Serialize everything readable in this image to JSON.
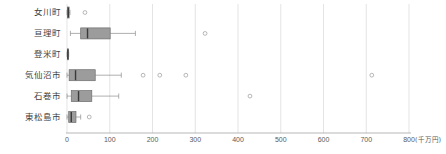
{
  "chart_data": {
    "type": "box",
    "title": "",
    "xlabel": "(千万円)",
    "ylabel": "",
    "xlim": [
      0,
      800
    ],
    "xticks": [
      0,
      100,
      200,
      300,
      400,
      500,
      600,
      700,
      800
    ],
    "xtick_labels": [
      "0",
      "100",
      "200",
      "300",
      "400",
      "500",
      "600",
      "700",
      "800"
    ],
    "unit_note": "(千万円)",
    "grid": true,
    "orientation": "horizontal",
    "legend": "none",
    "categories": [
      "女川町",
      "亘理町",
      "登米町",
      "気仙沼市",
      "石巻市",
      "東松島市"
    ],
    "boxes": [
      {
        "category": "女川町",
        "whisker_low": 0,
        "q1": 1,
        "median": 3,
        "q3": 5,
        "whisker_high": 7,
        "outliers": [
          42
        ]
      },
      {
        "category": "亘理町",
        "whisker_low": 8,
        "q1": 32,
        "median": 48,
        "q3": 101,
        "whisker_high": 160,
        "outliers": [
          323
        ]
      },
      {
        "category": "登米町",
        "whisker_low": 0,
        "q1": 1,
        "median": 2,
        "q3": 3,
        "whisker_high": 4,
        "outliers": []
      },
      {
        "category": "気仙沼市",
        "whisker_low": 0,
        "q1": 5,
        "median": 20,
        "q3": 66,
        "whisker_high": 127,
        "outliers": [
          178,
          217,
          278,
          713
        ]
      },
      {
        "category": "石巻市",
        "whisker_low": 0,
        "q1": 10,
        "median": 27,
        "q3": 58,
        "whisker_high": 121,
        "outliers": [
          428
        ]
      },
      {
        "category": "東松島市",
        "whisker_low": 0,
        "q1": 4,
        "median": 10,
        "q3": 21,
        "whisker_high": 32,
        "outliers": [
          52
        ]
      }
    ],
    "colors": {
      "box_fill": "#9c9c9c",
      "box_stroke": "#6e6e6e",
      "median": "#3a3a3a",
      "whisker": "#8e8e8e",
      "outlier": "#9a9a9a",
      "gridline": "#d8d8d8",
      "axis": "#9a9a9a",
      "text": "#3f3f3f",
      "background": "#ffffff"
    }
  }
}
